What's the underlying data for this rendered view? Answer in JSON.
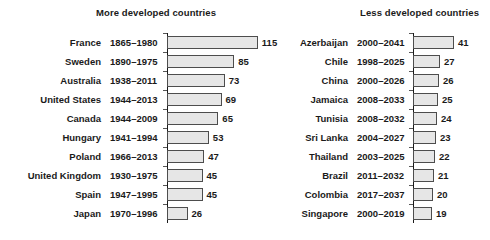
{
  "chart_data": {
    "type": "bar",
    "orientation": "horizontal",
    "title": "",
    "xlabel": "",
    "ylabel": "",
    "grid": false,
    "legend": null,
    "panels": [
      {
        "title": "More developed countries",
        "axis_line": true,
        "xlim": [
          0,
          115
        ],
        "categories": [
          "France",
          "Sweden",
          "Australia",
          "United States",
          "Canada",
          "Hungary",
          "Poland",
          "United Kingdom",
          "Spain",
          "Japan"
        ],
        "periods": [
          "1865–1980",
          "1890–1975",
          "1938–2011",
          "1944–2013",
          "1944–2009",
          "1941–1994",
          "1966–2013",
          "1930–1975",
          "1947–1995",
          "1970–1996"
        ],
        "values": [
          115,
          85,
          73,
          69,
          65,
          53,
          47,
          45,
          45,
          26
        ],
        "value_labels": [
          "115",
          "85",
          "73",
          "69",
          "65",
          "53",
          "47",
          "45",
          "45",
          "26"
        ]
      },
      {
        "title": "Less developed countries",
        "axis_line": true,
        "xlim": [
          0,
          41
        ],
        "categories": [
          "Azerbaijan",
          "Chile",
          "China",
          "Jamaica",
          "Tunisia",
          "Sri Lanka",
          "Thailand",
          "Brazil",
          "Colombia",
          "Singapore"
        ],
        "periods": [
          "2000–2041",
          "1998–2025",
          "2000–2026",
          "2008–2033",
          "2008–2032",
          "2004–2027",
          "2003–2025",
          "2011–2032",
          "2017–2037",
          "2000–2019"
        ],
        "values": [
          41,
          27,
          26,
          25,
          24,
          23,
          22,
          21,
          20,
          19
        ],
        "value_labels": [
          "41",
          "27",
          "26",
          "25",
          "24",
          "23",
          "22",
          "21",
          "20",
          "19"
        ]
      }
    ]
  },
  "style": {
    "bar_fill": "#e6e6e6",
    "bar_stroke": "#4d4d4d",
    "axis_color": "#1a1a1a",
    "text_color": "#1a1a1a",
    "background": "#ffffff"
  }
}
